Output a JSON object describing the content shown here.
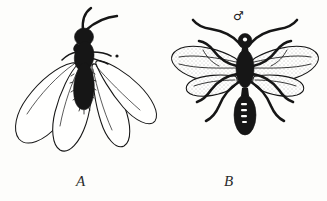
{
  "plate": {
    "background_color": "#fdfdfb",
    "ink_color": "#161616",
    "width": 327,
    "height": 201,
    "figures": [
      {
        "id": "A",
        "label": "A",
        "caption_label": "A",
        "view": "lateral-oblique",
        "subject": "winged ant alate with four wings spread downward",
        "wing_count": 4,
        "wing_style": "outline, unshaded",
        "body_style": "solid black silhouette",
        "antennae_count": 2
      },
      {
        "id": "B",
        "label": "B",
        "caption_label": "B",
        "view": "dorsal",
        "subject": "winged male ant alate with outspread wings and six legs",
        "wing_count": 4,
        "wing_style": "outline with stippled shading",
        "body_style": "solid black silhouette",
        "antennae_count": 2,
        "leg_count": 6,
        "sex_marker": "♂",
        "sex_marker_name": "male-symbol"
      }
    ]
  }
}
